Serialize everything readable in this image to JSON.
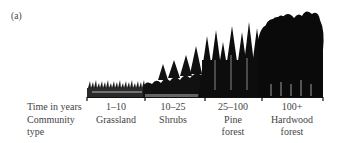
{
  "figure": {
    "panel_label": "(a)",
    "row_labels": {
      "time": "Time in years",
      "community_line1": "Community",
      "community_line2": "type"
    },
    "stages": [
      {
        "time": "1–10",
        "community_line1": "Grassland",
        "community_line2": ""
      },
      {
        "time": "10–25",
        "community_line1": "Shrubs",
        "community_line2": ""
      },
      {
        "time": "25–100",
        "community_line1": "Pine",
        "community_line2": "forest"
      },
      {
        "time": "100+",
        "community_line1": "Hardwood",
        "community_line2": "forest"
      }
    ],
    "colors": {
      "ink": "#111111",
      "text": "#444444",
      "background": "#ffffff"
    }
  }
}
